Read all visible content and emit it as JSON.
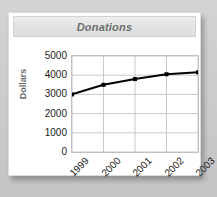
{
  "card": {
    "title": "Donations"
  },
  "chart_data": {
    "type": "line",
    "title": "Donations",
    "xlabel": "",
    "ylabel": "Dollars",
    "categories": [
      "1999",
      "2000",
      "2001",
      "2002",
      "2003"
    ],
    "values": [
      3000,
      3500,
      3800,
      4050,
      4150
    ],
    "series": [
      {
        "name": "Donations",
        "values": [
          3000,
          3500,
          3800,
          4050,
          4150
        ]
      }
    ],
    "ylim": [
      0,
      5000
    ],
    "yticks": [
      5000,
      4000,
      3000,
      2000,
      1000,
      0
    ],
    "ytick_labels": [
      "5000",
      "4000",
      "3000",
      "2000",
      "1000",
      "0"
    ],
    "xtick_labels": [
      "1999",
      "2000",
      "2001",
      "2002",
      "2003"
    ],
    "grid": true,
    "grid_color": "#c8c8d0",
    "legend": false,
    "legend_position": "none",
    "line_color": "#000000",
    "marker": "square",
    "xtick_rotation": -45
  }
}
